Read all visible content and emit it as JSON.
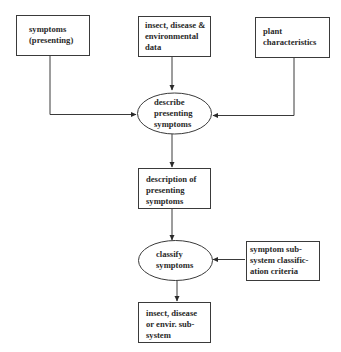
{
  "diagram": {
    "type": "flowchart",
    "nodes": [
      {
        "id": "symptoms_presenting",
        "shape": "rect",
        "lines": [
          "symptoms",
          "(presenting)"
        ]
      },
      {
        "id": "insect_disease_env_data",
        "shape": "rect",
        "lines": [
          "insect, disease &",
          "environmental",
          "data"
        ]
      },
      {
        "id": "plant_characteristics",
        "shape": "rect",
        "lines": [
          "plant",
          "characteristics"
        ]
      },
      {
        "id": "describe_presenting_symptoms",
        "shape": "ellipse",
        "lines": [
          "describe",
          "presenting",
          "symptoms"
        ]
      },
      {
        "id": "description_of_presenting_symptoms",
        "shape": "rect",
        "lines": [
          "description of",
          "presenting",
          "symptoms"
        ]
      },
      {
        "id": "classify_symptoms",
        "shape": "ellipse",
        "lines": [
          "classify",
          "symptoms"
        ]
      },
      {
        "id": "symptom_subsystem_criteria",
        "shape": "rect",
        "lines": [
          "symptom sub-",
          "system classific-",
          "ation criteria"
        ]
      },
      {
        "id": "insect_disease_envir_subsystem",
        "shape": "rect",
        "lines": [
          "insect, disease",
          "or envir. sub-",
          "system"
        ]
      }
    ],
    "edges": [
      {
        "from": "symptoms_presenting",
        "to": "describe_presenting_symptoms"
      },
      {
        "from": "insect_disease_env_data",
        "to": "describe_presenting_symptoms"
      },
      {
        "from": "plant_characteristics",
        "to": "describe_presenting_symptoms"
      },
      {
        "from": "describe_presenting_symptoms",
        "to": "description_of_presenting_symptoms"
      },
      {
        "from": "description_of_presenting_symptoms",
        "to": "classify_symptoms"
      },
      {
        "from": "symptom_subsystem_criteria",
        "to": "classify_symptoms"
      },
      {
        "from": "classify_symptoms",
        "to": "insect_disease_envir_subsystem"
      }
    ]
  }
}
